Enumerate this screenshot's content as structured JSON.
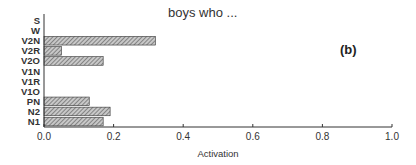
{
  "chart_data": {
    "type": "bar",
    "orientation": "horizontal",
    "title": "boys who ...",
    "panel_label": "(b)",
    "xlabel": "Activation",
    "ylabel": "",
    "xlim": [
      0.0,
      1.0
    ],
    "xticks": [
      "0.0",
      "0.2",
      "0.4",
      "0.6",
      "0.8",
      "1.0"
    ],
    "categories": [
      "S",
      "W",
      "V2N",
      "V2R",
      "V2O",
      "V1N",
      "V1R",
      "V1O",
      "PN",
      "N2",
      "N1"
    ],
    "values": [
      0.0,
      0.0,
      0.32,
      0.05,
      0.17,
      0.0,
      0.0,
      0.0,
      0.13,
      0.19,
      0.17
    ],
    "grid": false,
    "legend": null,
    "bar_fill": "hatched-gray"
  },
  "colors": {
    "axis": "#333333",
    "bar_fill": "#bdbdbd",
    "bar_hatch": "#555555",
    "bar_edge": "#333333"
  }
}
